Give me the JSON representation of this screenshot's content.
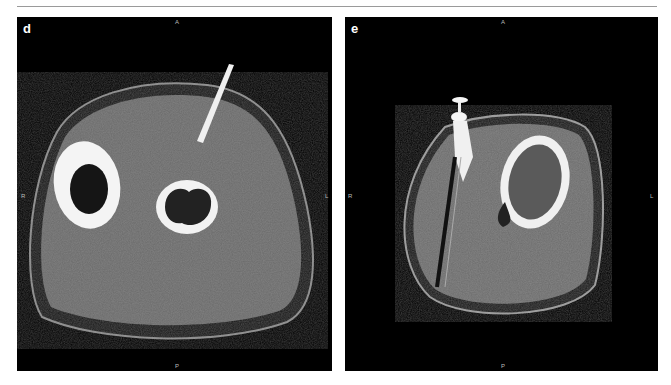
{
  "figure": {
    "panels": [
      {
        "label": "d",
        "orientation": {
          "anterior": "A",
          "posterior": "P",
          "right": "R",
          "left": "L"
        },
        "description": "Axial CT of forearm with needle entering soft tissue near radius"
      },
      {
        "label": "e",
        "orientation": {
          "anterior": "A",
          "posterior": "P",
          "right": "R",
          "left": "L"
        },
        "description": "Axial CT with metallic device and streak artifact adjacent to bone lesion"
      }
    ],
    "colors": {
      "background": "#ffffff",
      "panel": "#000000",
      "divider": "#9a9a9a"
    }
  }
}
